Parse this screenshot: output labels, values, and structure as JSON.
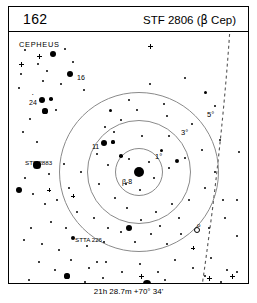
{
  "header": {
    "chart_number": "162",
    "title_prefix": "STF 2806 (",
    "title_beta": "β",
    "title_suffix": " Cep)"
  },
  "constellation_label": "CEPHEUS",
  "footer": {
    "coordinates": "21h 28.7m  +70° 34'"
  },
  "rings": [
    {
      "label": "1°",
      "radius_deg": 1,
      "cx": 130,
      "cy": 140,
      "r": 24,
      "label_x": 146,
      "label_y": 120
    },
    {
      "label": "3°",
      "radius_deg": 3,
      "cx": 130,
      "cy": 140,
      "r": 52,
      "label_x": 172,
      "label_y": 96
    },
    {
      "label": "5°",
      "radius_deg": 5,
      "cx": 130,
      "cy": 140,
      "r": 80,
      "label_x": 198,
      "label_y": 78
    }
  ],
  "star_labels": [
    {
      "id": "beta-cep",
      "text": "β-8",
      "x": 113,
      "y": 146,
      "size": "big"
    },
    {
      "id": "star-16",
      "text": "16",
      "x": 68,
      "y": 42,
      "size": "big"
    },
    {
      "id": "star-24",
      "text": "24",
      "x": 20,
      "y": 67,
      "size": "big"
    },
    {
      "id": "star-24-sup",
      "text": "•",
      "x": 23,
      "y": 61,
      "size": "sup"
    },
    {
      "id": "star-11",
      "text": "11",
      "x": 83,
      "y": 111,
      "size": "big"
    },
    {
      "id": "stf-2883",
      "text": "STF 2883",
      "x": 16,
      "y": 128,
      "size": "small"
    },
    {
      "id": "stta-226",
      "text": "STTA 226",
      "x": 66,
      "y": 205,
      "size": "small"
    },
    {
      "id": "star-7",
      "text": "7",
      "x": 143,
      "y": 253,
      "size": "big"
    },
    {
      "id": "omicron",
      "text": "o",
      "x": 188,
      "y": 190,
      "size": "small"
    }
  ],
  "stars": [
    {
      "x": 16,
      "y": 18,
      "r": 1.1
    },
    {
      "x": 29,
      "y": 32,
      "r": 1.3
    },
    {
      "x": 44,
      "y": 22,
      "r": 3.0
    },
    {
      "x": 56,
      "y": 17,
      "r": 1.2
    },
    {
      "x": 64,
      "y": 30,
      "r": 1.0
    },
    {
      "x": 38,
      "y": 39,
      "r": 1.0
    },
    {
      "x": 61,
      "y": 42,
      "r": 3.3
    },
    {
      "x": 52,
      "y": 52,
      "r": 1.4
    },
    {
      "x": 34,
      "y": 49,
      "r": 1.0
    },
    {
      "x": 75,
      "y": 58,
      "r": 1.1
    },
    {
      "x": 33,
      "y": 68,
      "r": 3.4
    },
    {
      "x": 42,
      "y": 67,
      "r": 1.8
    },
    {
      "x": 36,
      "y": 79,
      "r": 2.6
    },
    {
      "x": 47,
      "y": 78,
      "r": 1.4
    },
    {
      "x": 21,
      "y": 87,
      "r": 1.1
    },
    {
      "x": 14,
      "y": 100,
      "r": 1.0
    },
    {
      "x": 28,
      "y": 110,
      "r": 1.3
    },
    {
      "x": 101,
      "y": 78,
      "r": 1.5
    },
    {
      "x": 112,
      "y": 88,
      "r": 1.0
    },
    {
      "x": 96,
      "y": 95,
      "r": 1.1
    },
    {
      "x": 105,
      "y": 100,
      "r": 1.3
    },
    {
      "x": 95,
      "y": 111,
      "r": 3.4
    },
    {
      "x": 104,
      "y": 110,
      "r": 1.6
    },
    {
      "x": 88,
      "y": 122,
      "r": 1.2
    },
    {
      "x": 112,
      "y": 124,
      "r": 1.8
    },
    {
      "x": 99,
      "y": 133,
      "r": 1.1
    },
    {
      "x": 130,
      "y": 140,
      "r": 5.0
    },
    {
      "x": 120,
      "y": 127,
      "r": 1.4
    },
    {
      "x": 140,
      "y": 130,
      "r": 1.2
    },
    {
      "x": 145,
      "y": 146,
      "r": 1.3
    },
    {
      "x": 131,
      "y": 158,
      "r": 1.1
    },
    {
      "x": 117,
      "y": 152,
      "r": 1.0
    },
    {
      "x": 152,
      "y": 118,
      "r": 1.5
    },
    {
      "x": 160,
      "y": 104,
      "r": 1.2
    },
    {
      "x": 133,
      "y": 104,
      "r": 1.1
    },
    {
      "x": 120,
      "y": 68,
      "r": 1.3
    },
    {
      "x": 128,
      "y": 78,
      "r": 1.2
    },
    {
      "x": 155,
      "y": 72,
      "r": 1.3
    },
    {
      "x": 158,
      "y": 84,
      "r": 1.1
    },
    {
      "x": 141,
      "y": 52,
      "r": 1.0
    },
    {
      "x": 176,
      "y": 46,
      "r": 1.1
    },
    {
      "x": 196,
      "y": 60,
      "r": 1.5
    },
    {
      "x": 206,
      "y": 74,
      "r": 1.3
    },
    {
      "x": 183,
      "y": 92,
      "r": 1.0
    },
    {
      "x": 168,
      "y": 129,
      "r": 2.4
    },
    {
      "x": 176,
      "y": 126,
      "r": 1.3
    },
    {
      "x": 160,
      "y": 136,
      "r": 1.1
    },
    {
      "x": 193,
      "y": 118,
      "r": 1.2
    },
    {
      "x": 211,
      "y": 108,
      "r": 1.0
    },
    {
      "x": 206,
      "y": 140,
      "r": 1.2
    },
    {
      "x": 196,
      "y": 156,
      "r": 1.1
    },
    {
      "x": 214,
      "y": 168,
      "r": 1.3
    },
    {
      "x": 180,
      "y": 168,
      "r": 1.2
    },
    {
      "x": 163,
      "y": 172,
      "r": 1.4
    },
    {
      "x": 147,
      "y": 180,
      "r": 1.1
    },
    {
      "x": 132,
      "y": 188,
      "r": 1.2
    },
    {
      "x": 118,
      "y": 176,
      "r": 1.0
    },
    {
      "x": 106,
      "y": 166,
      "r": 1.1
    },
    {
      "x": 90,
      "y": 152,
      "r": 1.2
    },
    {
      "x": 72,
      "y": 140,
      "r": 1.3
    },
    {
      "x": 55,
      "y": 132,
      "r": 1.0
    },
    {
      "x": 28,
      "y": 133,
      "r": 3.6
    },
    {
      "x": 40,
      "y": 142,
      "r": 1.2
    },
    {
      "x": 16,
      "y": 146,
      "r": 1.1
    },
    {
      "x": 10,
      "y": 158,
      "r": 3.2
    },
    {
      "x": 24,
      "y": 162,
      "r": 1.2
    },
    {
      "x": 36,
      "y": 172,
      "r": 1.0
    },
    {
      "x": 48,
      "y": 168,
      "r": 1.3
    },
    {
      "x": 60,
      "y": 156,
      "r": 1.1
    },
    {
      "x": 68,
      "y": 180,
      "r": 1.2
    },
    {
      "x": 85,
      "y": 186,
      "r": 1.0
    },
    {
      "x": 99,
      "y": 196,
      "r": 1.2
    },
    {
      "x": 57,
      "y": 196,
      "r": 1.1
    },
    {
      "x": 42,
      "y": 190,
      "r": 1.3
    },
    {
      "x": 22,
      "y": 196,
      "r": 1.1
    },
    {
      "x": 15,
      "y": 208,
      "r": 1.2
    },
    {
      "x": 33,
      "y": 212,
      "r": 1.1
    },
    {
      "x": 50,
      "y": 218,
      "r": 1.3
    },
    {
      "x": 64,
      "y": 206,
      "r": 2.0
    },
    {
      "x": 78,
      "y": 214,
      "r": 1.1
    },
    {
      "x": 95,
      "y": 210,
      "r": 1.2
    },
    {
      "x": 112,
      "y": 200,
      "r": 1.4
    },
    {
      "x": 126,
      "y": 210,
      "r": 1.0
    },
    {
      "x": 142,
      "y": 202,
      "r": 1.2
    },
    {
      "x": 158,
      "y": 212,
      "r": 1.1
    },
    {
      "x": 172,
      "y": 202,
      "r": 1.3
    },
    {
      "x": 200,
      "y": 196,
      "r": 1.2
    },
    {
      "x": 216,
      "y": 186,
      "r": 1.1
    },
    {
      "x": 120,
      "y": 196,
      "r": 3.4
    },
    {
      "x": 151,
      "y": 194,
      "r": 1.2
    },
    {
      "x": 30,
      "y": 230,
      "r": 1.1
    },
    {
      "x": 46,
      "y": 238,
      "r": 1.2
    },
    {
      "x": 62,
      "y": 228,
      "r": 1.0
    },
    {
      "x": 80,
      "y": 236,
      "r": 1.2
    },
    {
      "x": 97,
      "y": 230,
      "r": 1.1
    },
    {
      "x": 113,
      "y": 240,
      "r": 1.3
    },
    {
      "x": 131,
      "y": 232,
      "r": 1.0
    },
    {
      "x": 149,
      "y": 240,
      "r": 1.2
    },
    {
      "x": 166,
      "y": 228,
      "r": 1.1
    },
    {
      "x": 184,
      "y": 236,
      "r": 1.2
    },
    {
      "x": 202,
      "y": 226,
      "r": 1.3
    },
    {
      "x": 218,
      "y": 238,
      "r": 1.0
    },
    {
      "x": 20,
      "y": 248,
      "r": 1.1
    },
    {
      "x": 40,
      "y": 252,
      "r": 1.2
    },
    {
      "x": 58,
      "y": 244,
      "r": 2.6
    },
    {
      "x": 76,
      "y": 250,
      "r": 1.1
    },
    {
      "x": 94,
      "y": 246,
      "r": 1.2
    },
    {
      "x": 138,
      "y": 252,
      "r": 3.8
    },
    {
      "x": 156,
      "y": 248,
      "r": 1.1
    },
    {
      "x": 178,
      "y": 252,
      "r": 1.2
    },
    {
      "x": 196,
      "y": 244,
      "r": 1.1
    },
    {
      "x": 212,
      "y": 250,
      "r": 1.3
    },
    {
      "x": 228,
      "y": 240,
      "r": 1.1
    },
    {
      "x": 228,
      "y": 204,
      "r": 1.2
    },
    {
      "x": 228,
      "y": 168,
      "r": 1.0
    },
    {
      "x": 230,
      "y": 120,
      "r": 1.1
    },
    {
      "x": 12,
      "y": 42,
      "r": 1.0
    },
    {
      "x": 10,
      "y": 56,
      "r": 1.1
    },
    {
      "x": 88,
      "y": 230,
      "r": 1.0
    },
    {
      "x": 170,
      "y": 186,
      "r": 1.1
    }
  ],
  "open_stars": [
    {
      "x": 188,
      "y": 198,
      "r": 3.2
    }
  ],
  "cross_marks": [
    {
      "x": 30,
      "y": 24,
      "w": 5
    },
    {
      "x": 141,
      "y": 14,
      "w": 5
    },
    {
      "x": 12,
      "y": 32,
      "w": 5
    },
    {
      "x": 64,
      "y": 164,
      "w": 4
    },
    {
      "x": 200,
      "y": 246,
      "w": 5
    },
    {
      "x": 223,
      "y": 244,
      "w": 5
    },
    {
      "x": 132,
      "y": 244,
      "w": 5
    },
    {
      "x": 184,
      "y": 216,
      "w": 4
    },
    {
      "x": 40,
      "y": 158,
      "w": 4
    }
  ]
}
